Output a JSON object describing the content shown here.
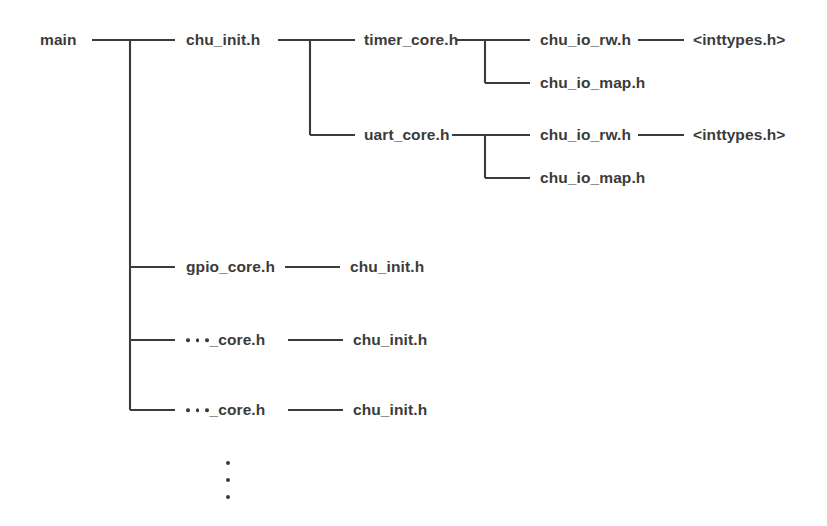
{
  "diagram": {
    "type": "header-dependency-tree",
    "background_color": "#ffffff",
    "line_color": "#3b3b3b",
    "text_color": "#3b3b3b",
    "root": {
      "label": "main"
    },
    "nodes": {
      "main": "main",
      "chu_init_top": "chu_init.h",
      "timer_core": "timer_core.h",
      "uart_core": "uart_core.h",
      "timer_io_rw": "chu_io_rw.h",
      "timer_inttypes": "<inttypes.h>",
      "timer_io_map": "chu_io_map.h",
      "uart_io_rw": "chu_io_rw.h",
      "uart_inttypes": "<inttypes.h>",
      "uart_io_map": "chu_io_map.h",
      "gpio_core": "gpio_core.h",
      "gpio_chu_init": "chu_init.h",
      "generic_core_1_suffix": "_core.h",
      "generic_core_1_chu_init": "chu_init.h",
      "generic_core_2_suffix": "_core.h",
      "generic_core_2_chu_init": "chu_init.h"
    },
    "vertical_ellipsis_dot_count": 3,
    "inline_ellipsis_dot_count": 3
  }
}
